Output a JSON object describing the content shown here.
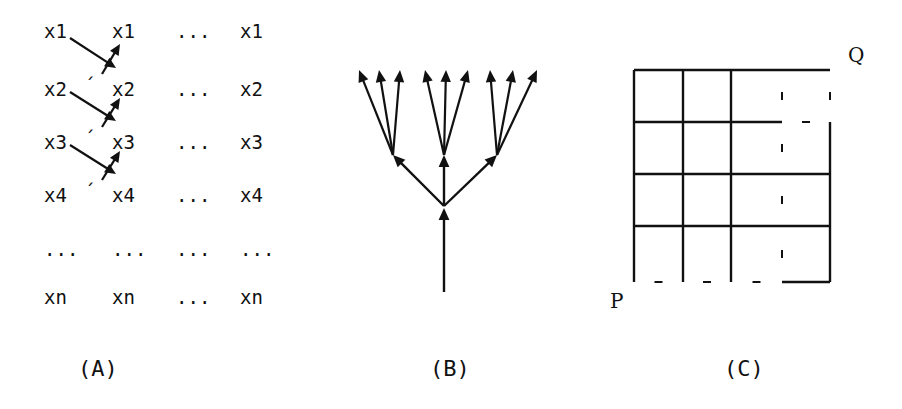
{
  "figure": {
    "panels": [
      {
        "id": "A",
        "label": "(A)",
        "label_x": 78,
        "label_y": 358,
        "description": "matrix of state columns with transition arrows",
        "columns": [
          {
            "x": 44,
            "name": "column-source"
          },
          {
            "x": 112,
            "name": "column-next"
          },
          {
            "x": 176,
            "name": "column-ellipsis"
          },
          {
            "x": 240,
            "name": "column-final"
          }
        ],
        "rows": [
          {
            "y": 22,
            "labels": [
              "x1",
              "x1",
              "...",
              "x1"
            ],
            "prime": false
          },
          {
            "y": 80,
            "labels": [
              "x2",
              "x2",
              "...",
              "x2"
            ],
            "prime": true
          },
          {
            "y": 133,
            "labels": [
              "x3",
              "x3",
              "...",
              "x3"
            ],
            "prime": true
          },
          {
            "y": 186,
            "labels": [
              "x4",
              "x4",
              "...",
              "x4"
            ],
            "prime": true
          },
          {
            "y": 240,
            "labels": [
              "...",
              "...",
              "...",
              "..."
            ],
            "prime": false
          },
          {
            "y": 288,
            "labels": [
              "xn",
              "xn",
              "...",
              "xn"
            ],
            "prime": false
          }
        ],
        "prime_glyph": "´",
        "arrows": [
          {
            "from_x": 70,
            "from_y": 38,
            "to_x": 116,
            "to_y": 68,
            "head": "down-right"
          },
          {
            "from_x": 102,
            "from_y": 74,
            "to_x": 120,
            "to_y": 44,
            "head": "up-right"
          },
          {
            "from_x": 70,
            "from_y": 92,
            "to_x": 116,
            "to_y": 121,
            "head": "down-right"
          },
          {
            "from_x": 102,
            "from_y": 127,
            "to_x": 120,
            "to_y": 98,
            "head": "up-right"
          },
          {
            "from_x": 70,
            "from_y": 145,
            "to_x": 116,
            "to_y": 174,
            "head": "down-right"
          },
          {
            "from_x": 102,
            "from_y": 180,
            "to_x": 120,
            "to_y": 151,
            "head": "up-right"
          }
        ]
      },
      {
        "id": "B",
        "label": "(B)",
        "label_x": 430,
        "label_y": 358,
        "description": "branching tree with trunk, three branches and three leaf arrows each",
        "root": {
          "x": 444,
          "y": 292
        },
        "split": {
          "x": 444,
          "y": 206
        },
        "branch_nodes": [
          {
            "x": 393,
            "y": 155
          },
          {
            "x": 444,
            "y": 155
          },
          {
            "x": 497,
            "y": 155
          }
        ],
        "leaves": [
          {
            "x": 359,
            "y": 70
          },
          {
            "x": 379,
            "y": 70
          },
          {
            "x": 400,
            "y": 70
          },
          {
            "x": 425,
            "y": 70
          },
          {
            "x": 446,
            "y": 70
          },
          {
            "x": 468,
            "y": 70
          },
          {
            "x": 490,
            "y": 70
          },
          {
            "x": 513,
            "y": 70
          },
          {
            "x": 537,
            "y": 70
          }
        ]
      },
      {
        "id": "C",
        "label": "(C)",
        "label_x": 724,
        "label_y": 358,
        "description": "four by four lattice grid with a monotone staircase path erased from P to Q",
        "grid": {
          "x_lines": [
            634,
            683,
            731,
            782,
            830
          ],
          "y_lines": [
            70,
            122,
            174,
            226,
            282
          ],
          "rows": 4,
          "cols": 4
        },
        "start_label": "P",
        "start_label_x": 610,
        "start_label_y": 291,
        "end_label": "Q",
        "end_label_x": 848,
        "end_label_y": 45
      }
    ]
  },
  "colors": {
    "ink": "#111111",
    "background": "#ffffff"
  }
}
